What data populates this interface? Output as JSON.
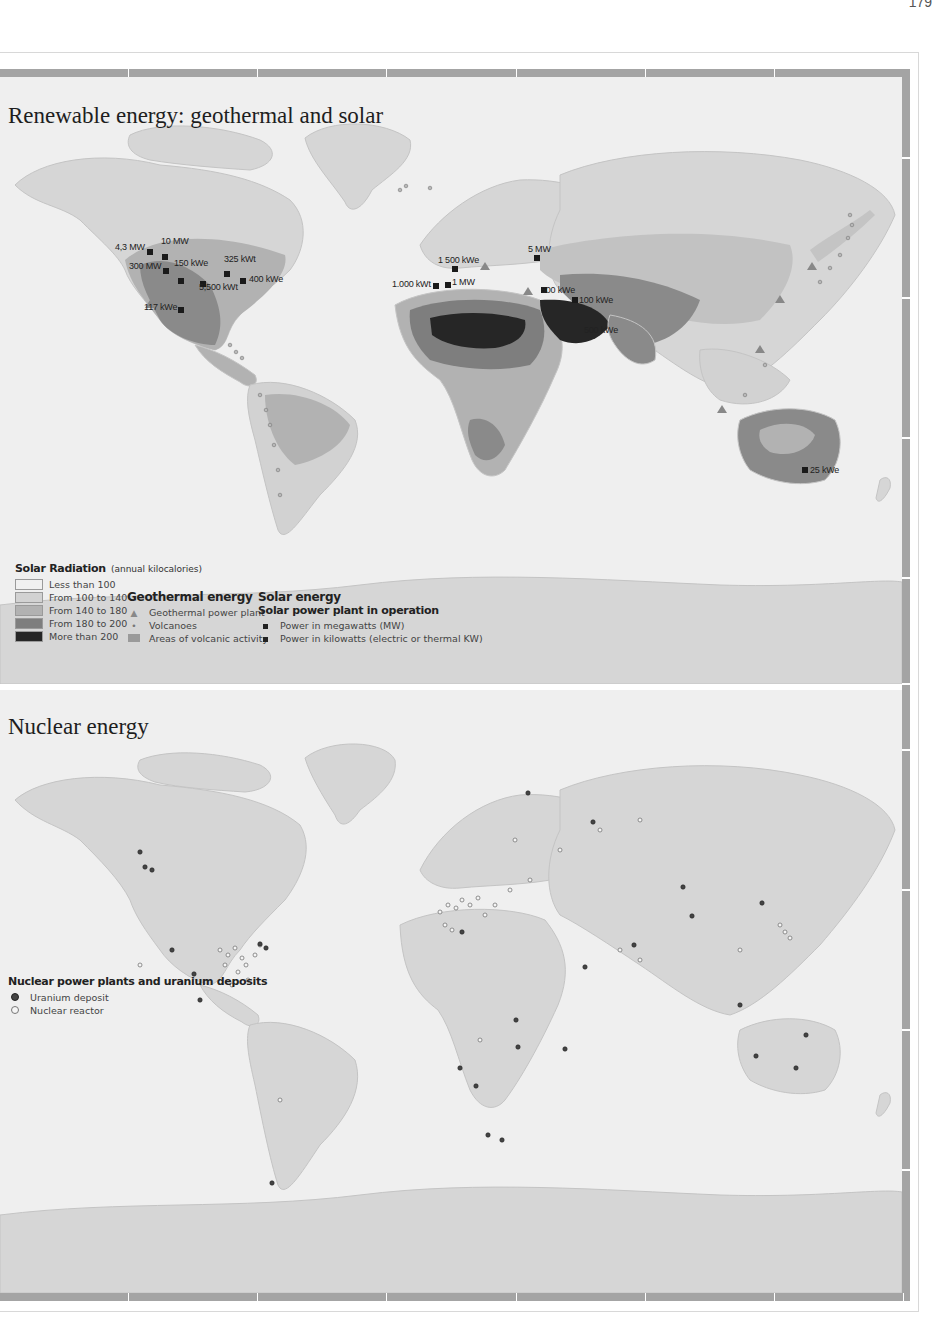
{
  "page": {
    "page_number": "179"
  },
  "colors": {
    "background": "#efefef",
    "land": "#d6d6d6",
    "frame_bar": "#a4a4a4",
    "radiation_lt100": "#f0f0f0",
    "radiation_100_140": "#d2d2d2",
    "radiation_140_180": "#b2b2b2",
    "radiation_180_200": "#7e7e7e",
    "radiation_gt200": "#262626",
    "volcanic_area": "#9a9a9a"
  },
  "top_map": {
    "title": "Renewable energy: geothermal and solar",
    "solar_plant_labels": [
      {
        "label": "4,3 MW",
        "x": 115,
        "y": 272
      },
      {
        "label": "10 MW",
        "x": 161,
        "y": 266
      },
      {
        "label": "300 MW",
        "x": 130,
        "y": 290
      },
      {
        "label": "150 kWe",
        "x": 174,
        "y": 288
      },
      {
        "label": "325 kWt",
        "x": 224,
        "y": 282
      },
      {
        "label": "400 kWe",
        "x": 249,
        "y": 297
      },
      {
        "label": "5,500 kWt",
        "x": 199,
        "y": 304
      },
      {
        "label": "117 kWe",
        "x": 144,
        "y": 307
      },
      {
        "label": "1 500 kWe",
        "x": 438,
        "y": 256
      },
      {
        "label": "5 MW",
        "x": 528,
        "y": 245
      },
      {
        "label": "1.000 kWt",
        "x": 393,
        "y": 281
      },
      {
        "label": "1 MW",
        "x": 449,
        "y": 279
      },
      {
        "label": "500 kWe",
        "x": 541,
        "y": 287
      },
      {
        "label": "100 kWe",
        "x": 578,
        "y": 298
      },
      {
        "label": "500 kWe",
        "x": 585,
        "y": 326
      },
      {
        "label": "25 kWe",
        "x": 809,
        "y": 466
      }
    ],
    "legend": {
      "solar_radiation": {
        "title": "Solar Radiation",
        "subtitle": "(annual kilocalories)",
        "items": [
          {
            "label": "Less than 100",
            "color": "#f0f0f0"
          },
          {
            "label": "From 100 to 140",
            "color": "#d2d2d2"
          },
          {
            "label": "From 140 to 180",
            "color": "#b2b2b2"
          },
          {
            "label": "From 180 to 200",
            "color": "#7e7e7e"
          },
          {
            "label": "More than 200",
            "color": "#262626"
          }
        ]
      },
      "geothermal": {
        "title": "Geothermal energy",
        "items": [
          {
            "label": "Geothermal power plant",
            "icon": "triangle-icon"
          },
          {
            "label": "Volcanoes",
            "icon": "dot-icon"
          },
          {
            "label": "Areas of volcanic activity",
            "icon": "area-swatch-icon"
          }
        ]
      },
      "solar": {
        "title": "Solar energy",
        "subtitle": "Solar power plant in operation",
        "items": [
          {
            "label": "Power in megawatts (MW)",
            "icon": "square-icon"
          },
          {
            "label": "Power in kilowatts (electric or thermal KW)",
            "icon": "square-icon"
          }
        ]
      }
    }
  },
  "bottom_map": {
    "title": "Nuclear energy",
    "legend": {
      "title": "Nuclear power plants and uranium deposits",
      "items": [
        {
          "label": "Uranium deposit",
          "icon": "filled-circle-icon"
        },
        {
          "label": "Nuclear reactor",
          "icon": "hollow-circle-icon"
        }
      ]
    }
  }
}
